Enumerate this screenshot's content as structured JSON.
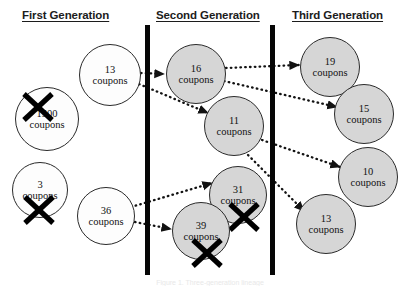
{
  "figure": {
    "width": 420,
    "height": 289,
    "background": "#ffffff",
    "caption": "Figure 1. Three-generation lineage"
  },
  "headers": [
    {
      "id": "first",
      "label": "First Generation",
      "x": 22,
      "y": 9
    },
    {
      "id": "second",
      "label": "Second Generation",
      "x": 156,
      "y": 9
    },
    {
      "id": "third",
      "label": "Third Generation",
      "x": 292,
      "y": 9
    }
  ],
  "dividers": [
    {
      "id": "divider-1",
      "x": 145,
      "y": 25,
      "w": 5,
      "h": 250,
      "color": "#060606"
    },
    {
      "id": "divider-2",
      "x": 270,
      "y": 25,
      "w": 5,
      "h": 250,
      "color": "#060606"
    }
  ],
  "nodes": [
    {
      "id": "gen1-13",
      "generation": "first",
      "number": "13",
      "unit": "coupons",
      "cx": 110,
      "cy": 75,
      "r": 31,
      "fill": "white",
      "crossed": false
    },
    {
      "id": "gen1-1500",
      "generation": "first",
      "number": "1500",
      "unit": "coupons",
      "cx": 47,
      "cy": 119,
      "r": 32,
      "fill": "white",
      "crossed": true,
      "cross_x": 21,
      "cross_y": 90,
      "cross_size": 34
    },
    {
      "id": "gen1-3",
      "generation": "first",
      "number": "3",
      "unit": "coupons",
      "cx": 40,
      "cy": 190,
      "r": 28,
      "fill": "white",
      "crossed": true,
      "cross_x": 22,
      "cross_y": 193,
      "cross_size": 34
    },
    {
      "id": "gen1-36",
      "generation": "first",
      "number": "36",
      "unit": "coupons",
      "cx": 106,
      "cy": 216,
      "r": 29,
      "fill": "white",
      "crossed": false
    },
    {
      "id": "gen2-16",
      "generation": "second",
      "number": "16",
      "unit": "coupons",
      "cx": 196,
      "cy": 74,
      "r": 30,
      "fill": "gray",
      "crossed": false
    },
    {
      "id": "gen2-11",
      "generation": "second",
      "number": "11",
      "unit": "coupons",
      "cx": 234,
      "cy": 126,
      "r": 30,
      "fill": "gray",
      "crossed": false
    },
    {
      "id": "gen2-31",
      "generation": "second",
      "number": "31",
      "unit": "coupons",
      "cx": 238,
      "cy": 195,
      "r": 29,
      "fill": "gray",
      "crossed": true,
      "cross_x": 227,
      "cross_y": 200,
      "cross_size": 34
    },
    {
      "id": "gen2-39",
      "generation": "second",
      "number": "39",
      "unit": "coupons",
      "cx": 201,
      "cy": 231,
      "r": 29,
      "fill": "gray",
      "crossed": true,
      "cross_x": 190,
      "cross_y": 236,
      "cross_size": 34
    },
    {
      "id": "gen3-19",
      "generation": "third",
      "number": "19",
      "unit": "coupons",
      "cx": 330,
      "cy": 67,
      "r": 30,
      "fill": "gray",
      "crossed": false
    },
    {
      "id": "gen3-15",
      "generation": "third",
      "number": "15",
      "unit": "coupons",
      "cx": 364,
      "cy": 114,
      "r": 30,
      "fill": "gray",
      "crossed": false
    },
    {
      "id": "gen3-10",
      "generation": "third",
      "number": "10",
      "unit": "coupons",
      "cx": 368,
      "cy": 177,
      "r": 30,
      "fill": "gray",
      "crossed": false
    },
    {
      "id": "gen3-13",
      "generation": "third",
      "number": "13",
      "unit": "coupons",
      "cx": 326,
      "cy": 224,
      "r": 30,
      "fill": "gray",
      "crossed": false
    }
  ],
  "arrows": [
    {
      "id": "arrow-13-to-16",
      "from": "gen1-13",
      "to": "gen2-16",
      "x1": 141,
      "y1": 73,
      "x2": 164,
      "y2": 74
    },
    {
      "id": "arrow-13-to-11",
      "from": "gen1-13",
      "to": "gen2-11",
      "x1": 139,
      "y1": 84,
      "x2": 208,
      "y2": 113
    },
    {
      "id": "arrow-36-to-31",
      "from": "gen1-36",
      "to": "gen2-31",
      "x1": 131,
      "y1": 207,
      "x2": 212,
      "y2": 183
    },
    {
      "id": "arrow-36-to-39",
      "from": "gen1-36",
      "to": "gen2-39",
      "x1": 135,
      "y1": 222,
      "x2": 171,
      "y2": 229
    },
    {
      "id": "arrow-16-to-19",
      "from": "gen2-16",
      "to": "gen3-19",
      "x1": 226,
      "y1": 68,
      "x2": 299,
      "y2": 65
    },
    {
      "id": "arrow-16-to-15",
      "from": "gen2-16",
      "to": "gen3-15",
      "x1": 224,
      "y1": 81,
      "x2": 337,
      "y2": 107
    },
    {
      "id": "arrow-11-to-10",
      "from": "gen2-11",
      "to": "gen3-10",
      "x1": 262,
      "y1": 140,
      "x2": 340,
      "y2": 167
    },
    {
      "id": "arrow-11-to-13",
      "from": "gen2-11",
      "to": "gen3-13",
      "x1": 248,
      "y1": 155,
      "x2": 304,
      "y2": 211
    }
  ],
  "style": {
    "arrow_color": "#121212",
    "circle_stroke": "#2b2b2b",
    "fill_white": "#fdfdfd",
    "fill_gray": "#d6d6d6",
    "header_color": "#1c1c1c"
  }
}
